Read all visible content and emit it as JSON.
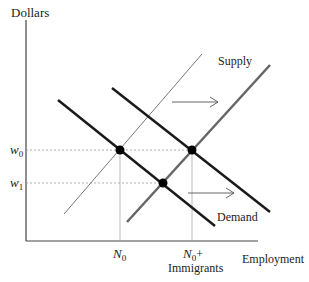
{
  "diagram": {
    "type": "supply-demand",
    "axes": {
      "y_label": "Dollars",
      "x_label": "Employment"
    },
    "wage_labels": [
      {
        "base": "w",
        "sub": "0"
      },
      {
        "base": "w",
        "sub": "1"
      }
    ],
    "employment_labels": [
      {
        "base": "N",
        "sub": "0",
        "suffix": ""
      },
      {
        "base": "N",
        "sub": "0",
        "suffix": "+",
        "line2": "Immigrants"
      }
    ],
    "curves": {
      "supply_label": "Supply",
      "demand_label": "Demand"
    },
    "colors": {
      "demand": "#1a1a1a",
      "supply_original": "#777777",
      "supply_shifted": "#666666",
      "guide": "#9a9a9a",
      "axis": "#444444"
    }
  }
}
